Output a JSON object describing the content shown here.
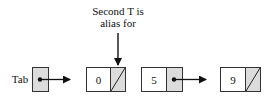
{
  "annotation": {
    "line1": "Second T is",
    "line2": "alias for"
  },
  "head": {
    "label": "Tab"
  },
  "nodes": [
    {
      "value": "0",
      "next": "null"
    },
    {
      "value": "5",
      "next": "node-9"
    },
    {
      "value": "9",
      "next": "null"
    }
  ],
  "colors": {
    "pointer_cell": "#dcdcdc",
    "stroke": "#333333"
  }
}
